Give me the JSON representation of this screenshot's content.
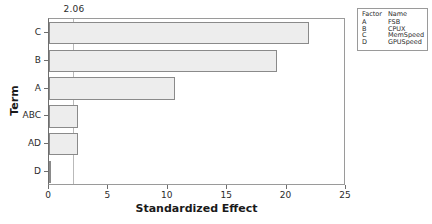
{
  "chart_data": {
    "type": "bar",
    "orientation": "horizontal",
    "title": "",
    "xlabel": "Standardized Effect",
    "ylabel": "Term",
    "categories": [
      "C",
      "B",
      "A",
      "ABC",
      "AD",
      "D"
    ],
    "values": [
      21.9,
      19.2,
      10.6,
      2.45,
      2.45,
      0.1
    ],
    "xlim": [
      0,
      25
    ],
    "xticks": [
      0,
      5,
      10,
      15,
      20,
      25
    ],
    "xtick_labels": [
      "0",
      "5",
      "10",
      "15",
      "20",
      "25"
    ],
    "grid": false,
    "legend_position": "top-right",
    "reference_line": {
      "value": 2.06,
      "label": "2.06",
      "orientation": "vertical"
    },
    "colors": {
      "bar_fill": "#ededed",
      "bar_border": "#8a8a8a",
      "axis": "#6e6e6e",
      "reference_line": "#b9b9b9",
      "text": "#2b2b2b"
    }
  },
  "legend": {
    "headers": [
      "Factor",
      "Name"
    ],
    "rows": [
      {
        "factor": "A",
        "name": "FSB"
      },
      {
        "factor": "B",
        "name": "CPUX"
      },
      {
        "factor": "C",
        "name": "MemSpeed"
      },
      {
        "factor": "D",
        "name": "GPUSpeed"
      }
    ]
  }
}
